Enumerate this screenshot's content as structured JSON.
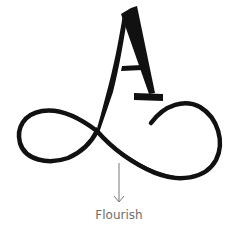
{
  "figure": {
    "letter": "A",
    "label": "Flourish",
    "ink_color": "#111111",
    "label_color": "#6e6e6e",
    "arrow_color": "#777777",
    "background": "#ffffff"
  }
}
